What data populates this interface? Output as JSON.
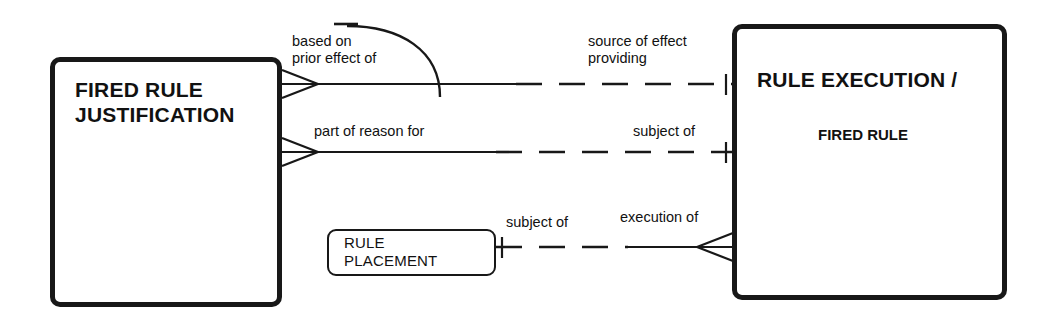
{
  "diagram": {
    "type": "entity-relationship-diagram",
    "background_color": "#ffffff",
    "line_color": "#181818",
    "entities": [
      {
        "id": "fired-rule-justification",
        "title": "FIRED RULE\nJUSTIFICATION",
        "subtitle": "",
        "x": 50,
        "y": 57,
        "width": 232,
        "height": 250,
        "border": "thick"
      },
      {
        "id": "rule-execution-fired-rule",
        "title": "RULE EXECUTION /",
        "subtitle": "FIRED RULE",
        "x": 732,
        "y": 24,
        "width": 275,
        "height": 276,
        "border": "thick"
      },
      {
        "id": "rule-placement",
        "title": "RULE\nPLACEMENT",
        "subtitle": "",
        "x": 327,
        "y": 229,
        "width": 169,
        "height": 47,
        "border": "thin"
      }
    ],
    "relationships": [
      {
        "id": "rel-based-on-prior-effect",
        "from": "fired-rule-justification",
        "to": "rule-execution-fired-rule",
        "left_label": "based on\nprior effect of",
        "right_label": "source of effect\nproviding",
        "left_cardinality": "many",
        "right_cardinality": "one",
        "recursive_arc": true
      },
      {
        "id": "rel-part-of-reason-for",
        "from": "fired-rule-justification",
        "to": "rule-execution-fired-rule",
        "left_label": "part of reason for",
        "right_label": "subject of",
        "left_cardinality": "many",
        "right_cardinality": "one",
        "recursive_arc": false
      },
      {
        "id": "rel-execution-of",
        "from": "rule-placement",
        "to": "rule-execution-fired-rule",
        "left_label": "subject of",
        "right_label": "execution of",
        "left_cardinality": "one",
        "right_cardinality": "many",
        "recursive_arc": false
      }
    ]
  },
  "labels": {
    "entity1_title": "FIRED RULE\nJUSTIFICATION",
    "entity2_title": "RULE EXECUTION /",
    "entity2_subtitle": "FIRED RULE",
    "entity3_title": "RULE\nPLACEMENT",
    "rel1_left": "based on\nprior effect of",
    "rel1_right": "source of effect\nproviding",
    "rel2_left": "part of reason for",
    "rel2_right": "subject of",
    "rel3_left": "subject of",
    "rel3_right": "execution of"
  }
}
